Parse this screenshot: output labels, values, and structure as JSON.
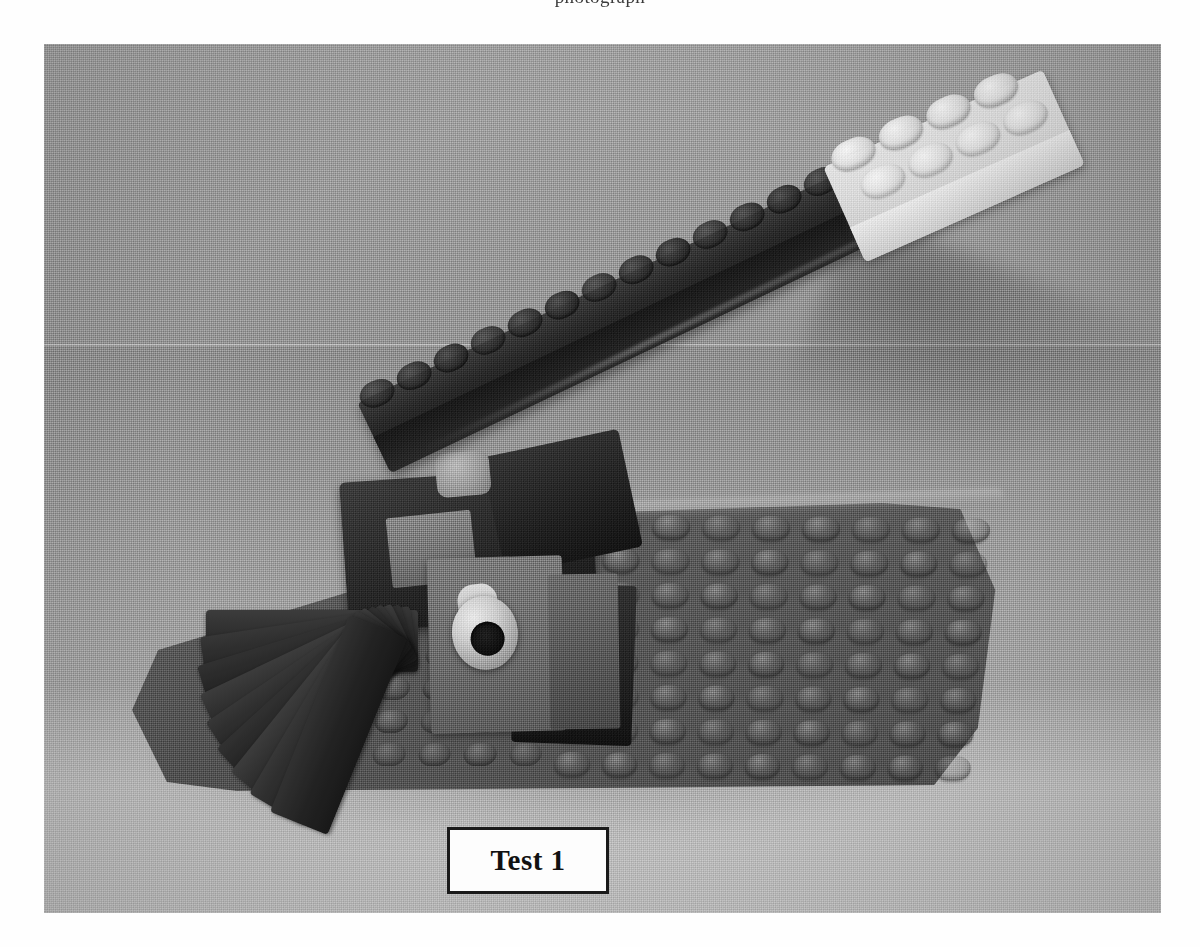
{
  "page": {
    "top_clipped_text": "photograph"
  },
  "figure": {
    "caption_label": "Test 1",
    "caption_box": {
      "border_color": "#1a1a1a",
      "background_color": "#fdfdfd"
    },
    "photo": {
      "alt_description": "Grayscale halftone photograph of a LEGO lever / catapult mechanism built on a dark studded baseplate, with a long dark diagonal beam topped by a white 2x4 brick, a pivot axle, and a fan of stacked dark angled plates on the left.",
      "background_color": "#9a9a9a",
      "parts": [
        {
          "name": "baseplate",
          "label": "dark studded baseplate",
          "color": "#575757"
        },
        {
          "name": "lever-beam",
          "label": "long dark diagonal beam with studs",
          "color": "#262626"
        },
        {
          "name": "white-brick",
          "label": "white 2x4 brick at top of beam",
          "color": "#dcdcdc"
        },
        {
          "name": "pivot-axle",
          "label": "light gray cylindrical axle bushing",
          "color": "#cdcdcd"
        },
        {
          "name": "pivot-housing",
          "label": "gray housing block holding the axle",
          "color": "#6d6d6d"
        },
        {
          "name": "fan-stack",
          "label": "fan of stacked dark angled plates",
          "color": "#2a2a2a"
        },
        {
          "name": "cast-shadow",
          "label": "soft cast shadow on table surface",
          "color": "#6e6e6e"
        }
      ],
      "stud_grid": {
        "right_field_rows": 8,
        "right_field_cols": 9,
        "left_field_rows": 4,
        "left_field_cols": 7
      },
      "beam_studs_count": 14,
      "white_brick_studs": {
        "rows": 2,
        "cols": 4
      },
      "fan_blades_count": 9
    }
  }
}
